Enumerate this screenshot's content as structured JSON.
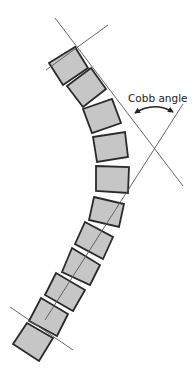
{
  "diagram": {
    "annotation": {
      "label": "Cobb angle",
      "x": 128,
      "y": 93
    },
    "colors": {
      "vertebra_fill": "#c6c6c6",
      "vertebra_stroke": "#2a2a2a",
      "line": "#555555",
      "text": "#222222"
    },
    "vertebrae": [
      {
        "points": "49,63 75,47 88,68 63,85"
      },
      {
        "points": "67,86 91,68 106,89 83,107"
      },
      {
        "points": "83,109 112,99 121,123 92,133"
      },
      {
        "points": "93,137 125,132 128,157 97,162"
      },
      {
        "points": "96,166 129,167 128,193 96,191"
      },
      {
        "points": "94,197 124,204 119,227 89,220"
      },
      {
        "points": "85,222 113,237 103,259 75,244"
      },
      {
        "points": "72,248 100,265 90,285 62,272"
      },
      {
        "points": "56,273 85,290 73,311 45,295"
      },
      {
        "points": "41,298 68,314 57,336 29,321"
      },
      {
        "points": "27,323 53,338 39,361 13,344"
      }
    ],
    "lines": [
      {
        "name": "upper-endplate-line",
        "x1": 46,
        "y1": 70,
        "x2": 108,
        "y2": 25
      },
      {
        "name": "upper-perpendicular-line",
        "x1": 55,
        "y1": 18,
        "x2": 183,
        "y2": 186
      },
      {
        "name": "lower-endplate-line",
        "x1": 10,
        "y1": 307,
        "x2": 73,
        "y2": 350
      },
      {
        "name": "lower-perpendicular-line",
        "x1": 45,
        "y1": 320,
        "x2": 183,
        "y2": 104
      }
    ],
    "angle_arrow": {
      "path": "M135,113 Q154,101 173,112"
    }
  }
}
